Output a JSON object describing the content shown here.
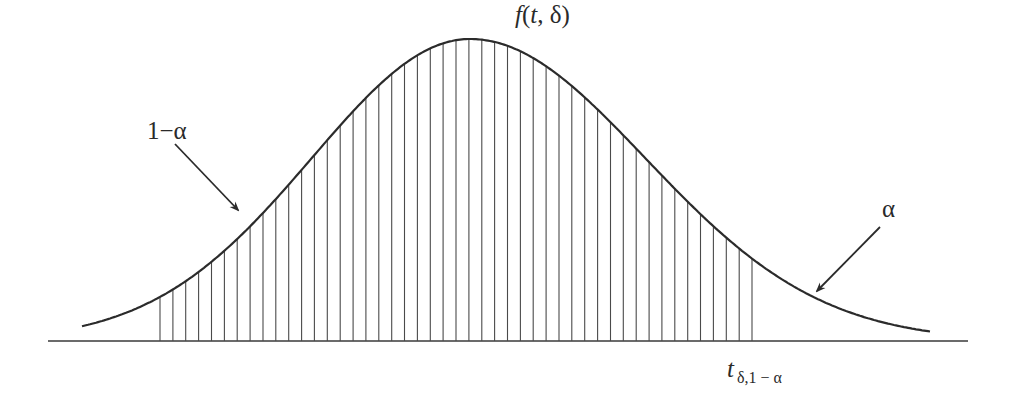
{
  "figure": {
    "curve_label": "f(t, δ)",
    "curve_label_parts": {
      "func": "f",
      "open": "(",
      "var": "t",
      "sep": ", ",
      "param": "δ",
      "close": ")"
    },
    "region_labels": {
      "acceptance": "1−α",
      "rejection": "α"
    },
    "critical_value": {
      "symbol": "t",
      "subscript": "δ,1 − α"
    },
    "colors": {
      "curve": "#2b2b2b",
      "hatch": "#4a4a4a",
      "axis": "#3a3a3a",
      "background": "#ffffff"
    },
    "geometry": {
      "baseline_y": 341,
      "baseline_x_start": 48,
      "baseline_x_end": 968,
      "curve_x_start": 82,
      "curve_x_end": 930,
      "peak_x": 470,
      "peak_y": 39,
      "left_sigma": 158,
      "right_sigma": 175,
      "hatch_x_start": 160,
      "hatch_x_end": 752,
      "hatch_spacing": 12.87
    },
    "arrows": [
      {
        "name": "acceptance-arrow",
        "x1": 175,
        "y1": 144,
        "x2": 238,
        "y2": 210
      },
      {
        "name": "rejection-arrow",
        "x1": 880,
        "y1": 227,
        "x2": 817,
        "y2": 291
      }
    ]
  }
}
